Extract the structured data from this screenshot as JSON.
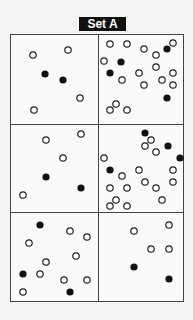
{
  "title": "Set A",
  "dots": {
    "open": [
      [
        33,
        55
      ],
      [
        68,
        50
      ],
      [
        80,
        98
      ],
      [
        34,
        110
      ],
      [
        110,
        44
      ],
      [
        127,
        44
      ],
      [
        144,
        49
      ],
      [
        156,
        55
      ],
      [
        173,
        43
      ],
      [
        104,
        61
      ],
      [
        122,
        80
      ],
      [
        139,
        73
      ],
      [
        156,
        67
      ],
      [
        173,
        73
      ],
      [
        162,
        80
      ],
      [
        173,
        85
      ],
      [
        144,
        85
      ],
      [
        110,
        110
      ],
      [
        116,
        104
      ],
      [
        127,
        110
      ],
      [
        46,
        140
      ],
      [
        81,
        134
      ],
      [
        63,
        158
      ],
      [
        23,
        195
      ],
      [
        151,
        140
      ],
      [
        145,
        146
      ],
      [
        156,
        152
      ],
      [
        104,
        158
      ],
      [
        122,
        176
      ],
      [
        139,
        170
      ],
      [
        173,
        170
      ],
      [
        110,
        188
      ],
      [
        127,
        188
      ],
      [
        145,
        182
      ],
      [
        156,
        188
      ],
      [
        173,
        182
      ],
      [
        162,
        200
      ],
      [
        116,
        200
      ],
      [
        110,
        206
      ],
      [
        127,
        206
      ],
      [
        70,
        231
      ],
      [
        87,
        237
      ],
      [
        29,
        243
      ],
      [
        76,
        256
      ],
      [
        46,
        262
      ],
      [
        40,
        274
      ],
      [
        64,
        280
      ],
      [
        87,
        280
      ],
      [
        23,
        292
      ],
      [
        134,
        231
      ],
      [
        169,
        225
      ],
      [
        151,
        249
      ],
      [
        169,
        249
      ]
    ],
    "filled": [
      [
        45,
        74
      ],
      [
        63,
        80
      ],
      [
        167,
        49
      ],
      [
        121,
        62
      ],
      [
        110,
        73
      ],
      [
        167,
        98
      ],
      [
        46,
        177
      ],
      [
        81,
        188
      ],
      [
        145,
        133
      ],
      [
        168,
        146
      ],
      [
        180,
        158
      ],
      [
        110,
        170
      ],
      [
        40,
        225
      ],
      [
        23,
        274
      ],
      [
        70,
        292
      ],
      [
        134,
        267
      ],
      [
        169,
        279
      ]
    ]
  },
  "panels": [
    {
      "name": "panel-1",
      "open": 4,
      "filled": 2
    },
    {
      "name": "panel-2",
      "open": 16,
      "filled": 4
    },
    {
      "name": "panel-3",
      "open": 4,
      "filled": 2
    },
    {
      "name": "panel-4",
      "open": 16,
      "filled": 4
    },
    {
      "name": "panel-5",
      "open": 9,
      "filled": 3
    },
    {
      "name": "panel-6",
      "open": 4,
      "filled": 2
    }
  ]
}
